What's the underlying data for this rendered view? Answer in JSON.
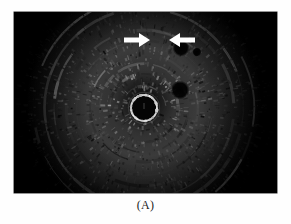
{
  "figure": {
    "caption": "(A)",
    "modality": "endorectal-ultrasound",
    "background_color": "#ffffff",
    "frame": {
      "fill_color": "#000000",
      "left": 14,
      "top": 12,
      "width": 263,
      "height": 181
    }
  },
  "annotations": {
    "arrows": [
      {
        "name": "arrow-left",
        "label": "",
        "direction": "right",
        "color": "#ffffff",
        "x": 110,
        "y": 20,
        "length": 26,
        "points_to": "hypoechoic-lesion"
      },
      {
        "name": "arrow-right",
        "label": "",
        "direction": "left",
        "color": "#ffffff",
        "x": 153,
        "y": 20,
        "length": 24,
        "points_to": "hypoechoic-lesion"
      }
    ]
  },
  "image_content": {
    "transducer": {
      "center_x": 144,
      "center_y": 108,
      "ring_radius": 13,
      "ring_color": "#d8d8d8",
      "lumen_color": "#050505"
    },
    "lesion": {
      "name": "hypoechoic-lesion",
      "center_x": 151,
      "center_y": 37,
      "radius_x": 17,
      "radius_y": 10
    },
    "nodes": [
      {
        "name": "node-upper-right",
        "center_x": 181,
        "center_y": 48,
        "radius": 7
      },
      {
        "name": "node-small-right",
        "center_x": 197,
        "center_y": 52,
        "radius": 3
      },
      {
        "name": "node-mid-right",
        "center_x": 180,
        "center_y": 90,
        "radius": 8
      }
    ],
    "texture": {
      "type": "radial-speckle",
      "rings": 9,
      "speckle_count": 2600,
      "bright_color": "#e6e6e6",
      "mid_color": "#707070",
      "dark_color": "#0a0a0a"
    }
  }
}
